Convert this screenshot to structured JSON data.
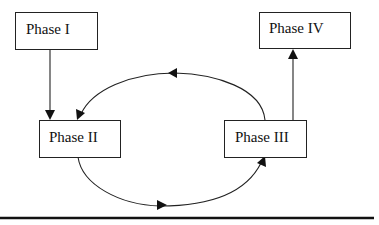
{
  "diagram": {
    "type": "flow",
    "nodes": [
      {
        "id": "phase1",
        "label": "Phase I"
      },
      {
        "id": "phase2",
        "label": "Phase II"
      },
      {
        "id": "phase3",
        "label": "Phase III"
      },
      {
        "id": "phase4",
        "label": "Phase IV"
      }
    ],
    "edges": [
      {
        "from": "phase1",
        "to": "phase2",
        "style": "straight"
      },
      {
        "from": "phase2",
        "to": "phase3",
        "style": "curved-below"
      },
      {
        "from": "phase3",
        "to": "phase2",
        "style": "curved-above"
      },
      {
        "from": "phase3",
        "to": "phase4",
        "style": "straight"
      }
    ],
    "colors": {
      "line": "#222222",
      "box_fill": "#ffffff",
      "text": "#111111"
    }
  }
}
